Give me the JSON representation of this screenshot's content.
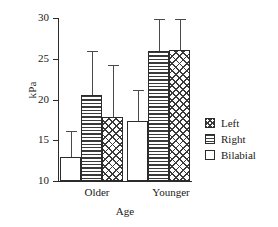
{
  "chart_data": {
    "type": "bar",
    "title": "",
    "xlabel": "Age",
    "ylabel": "kPa",
    "categories": [
      "Older",
      "Younger"
    ],
    "ylim": [
      10,
      30
    ],
    "yticks": [
      10,
      15,
      20,
      25,
      30
    ],
    "ytick_labels": [
      "10",
      "15",
      "20",
      "25",
      "30"
    ],
    "grid": false,
    "legend_position": "right",
    "series": [
      {
        "name": "Bilabial",
        "fill": "blank",
        "values": [
          12.9,
          17.4
        ],
        "error_high": [
          16.1,
          21.2
        ]
      },
      {
        "name": "Right",
        "fill": "hlines",
        "values": [
          20.5,
          26.0
        ],
        "error_high": [
          26.0,
          29.9
        ]
      },
      {
        "name": "Left",
        "fill": "cross",
        "values": [
          17.9,
          26.1
        ],
        "error_high": [
          24.2,
          29.9
        ]
      }
    ],
    "legend_order": [
      "Left",
      "Right",
      "Bilabial"
    ]
  },
  "axes": {
    "ylabel": "kPa",
    "xlabel": "Age",
    "ytick_labels": [
      "30",
      "25",
      "20",
      "15",
      "10"
    ],
    "xtick_labels": [
      "Older",
      "Younger"
    ]
  },
  "legend": {
    "items": [
      {
        "label": "Left",
        "swatch": "crosshatch-swatch"
      },
      {
        "label": "Right",
        "swatch": "horizontal-lines-swatch"
      },
      {
        "label": "Bilabial",
        "swatch": "blank-swatch"
      }
    ]
  },
  "colors": {
    "axis": "#2b2b2b",
    "hatch": "#3a3a3a",
    "error": "#4a4a4a",
    "background": "#ffffff"
  }
}
